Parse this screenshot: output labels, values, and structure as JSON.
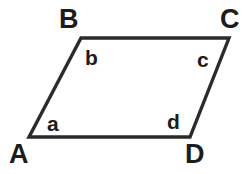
{
  "figure": {
    "type": "parallelogram",
    "name": "parallelogram-ABCD",
    "background_color": "#ffffff",
    "stroke_color": "#2b2b2b",
    "stroke_width": 3.4,
    "label_color": "#1c1c1c",
    "canvas": {
      "width": 246,
      "height": 174
    },
    "vertices": [
      {
        "id": "A",
        "label": "A",
        "x": 29,
        "y": 137,
        "position": "bottom-left"
      },
      {
        "id": "B",
        "label": "B",
        "x": 81,
        "y": 38,
        "position": "top-left"
      },
      {
        "id": "C",
        "label": "C",
        "x": 229,
        "y": 38,
        "position": "top-right"
      },
      {
        "id": "D",
        "label": "D",
        "x": 190,
        "y": 137,
        "position": "bottom-right"
      }
    ],
    "edges": [
      {
        "id": "AB",
        "from": "A",
        "to": "B"
      },
      {
        "id": "BC",
        "from": "B",
        "to": "C"
      },
      {
        "id": "CD",
        "from": "C",
        "to": "D"
      },
      {
        "id": "DA",
        "from": "D",
        "to": "A"
      }
    ],
    "interior_angles": [
      {
        "id": "a",
        "label": "a",
        "at_vertex": "A",
        "x": 53,
        "y": 123
      },
      {
        "id": "b",
        "label": "b",
        "at_vertex": "B",
        "x": 91,
        "y": 57
      },
      {
        "id": "c",
        "label": "c",
        "at_vertex": "C",
        "x": 203,
        "y": 59
      },
      {
        "id": "d",
        "label": "d",
        "at_vertex": "D",
        "x": 173,
        "y": 121
      }
    ]
  }
}
